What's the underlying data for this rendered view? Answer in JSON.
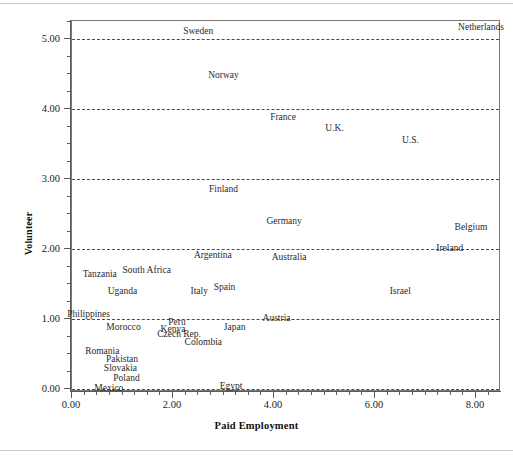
{
  "chart_data": {
    "type": "scatter",
    "title": "",
    "xlabel": "Paid Employment",
    "ylabel": "Volunteer",
    "xlim": [
      -0.4,
      8.5
    ],
    "ylim": [
      -0.27,
      5.48
    ],
    "grid": true,
    "grid_style": "dashed horizontal",
    "legend": "none",
    "point_marker": "label-only",
    "xticks": [
      "0.00",
      "2.00",
      "4.00",
      "6.00",
      "8.00"
    ],
    "xtick_values": [
      0.0,
      2.0,
      4.0,
      6.0,
      8.0
    ],
    "yticks": [
      "0.00",
      "1.00",
      "2.00",
      "3.00",
      "4.00",
      "5.00"
    ],
    "ytick_values": [
      0.0,
      1.0,
      2.0,
      3.0,
      4.0,
      5.0
    ],
    "points": [
      {
        "label": "Sweden",
        "x": 2.5,
        "y": 5.1
      },
      {
        "label": "Netherlands",
        "x": 8.1,
        "y": 5.16
      },
      {
        "label": "Norway",
        "x": 3.0,
        "y": 4.47
      },
      {
        "label": "France",
        "x": 4.18,
        "y": 3.87
      },
      {
        "label": "U.K.",
        "x": 5.2,
        "y": 3.71
      },
      {
        "label": "U.S.",
        "x": 6.7,
        "y": 3.55
      },
      {
        "label": "Finland",
        "x": 3.0,
        "y": 2.84
      },
      {
        "label": "Germany",
        "x": 4.2,
        "y": 2.38
      },
      {
        "label": "Belgium",
        "x": 7.9,
        "y": 2.3
      },
      {
        "label": "Ireland",
        "x": 7.48,
        "y": 2.0
      },
      {
        "label": "Argentina",
        "x": 2.79,
        "y": 1.9
      },
      {
        "label": "Australia",
        "x": 4.3,
        "y": 1.87
      },
      {
        "label": "South Africa",
        "x": 1.48,
        "y": 1.68
      },
      {
        "label": "Tanzania",
        "x": 0.55,
        "y": 1.63
      },
      {
        "label": "Spain",
        "x": 3.02,
        "y": 1.45
      },
      {
        "label": "Italy",
        "x": 2.52,
        "y": 1.39
      },
      {
        "label": "Israel",
        "x": 6.5,
        "y": 1.39
      },
      {
        "label": "Uganda",
        "x": 1.0,
        "y": 1.39
      },
      {
        "label": "Philippines",
        "x": 0.33,
        "y": 1.06
      },
      {
        "label": "Austria",
        "x": 4.05,
        "y": 1.0
      },
      {
        "label": "Peru",
        "x": 2.08,
        "y": 0.94
      },
      {
        "label": "Morocco",
        "x": 1.02,
        "y": 0.87
      },
      {
        "label": "Kenya",
        "x": 2.0,
        "y": 0.85
      },
      {
        "label": "Japan",
        "x": 3.22,
        "y": 0.87
      },
      {
        "label": "Czech Rep.",
        "x": 2.12,
        "y": 0.77
      },
      {
        "label": "Colombia",
        "x": 2.6,
        "y": 0.66
      },
      {
        "label": "Romania",
        "x": 0.6,
        "y": 0.53
      },
      {
        "label": "Pakistan",
        "x": 0.99,
        "y": 0.42
      },
      {
        "label": "Slovakia",
        "x": 0.96,
        "y": 0.29
      },
      {
        "label": "Poland",
        "x": 1.08,
        "y": 0.15
      },
      {
        "label": "Mexico",
        "x": 0.73,
        "y": 0.0
      },
      {
        "label": "Egypt",
        "x": 3.15,
        "y": 0.03
      }
    ]
  },
  "axes": {
    "y_title": "Volunteer",
    "x_title": "Paid Employment"
  }
}
